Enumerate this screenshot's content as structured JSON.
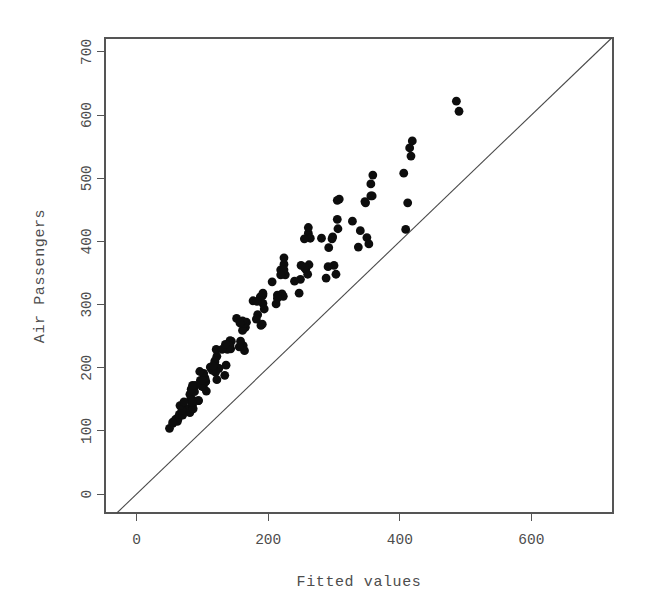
{
  "chart_data": {
    "type": "scatter",
    "title": "",
    "xlabel": "Fitted values",
    "ylabel": "Air Passengers",
    "xlim": [
      -48,
      724
    ],
    "ylim": [
      -30,
      722
    ],
    "xticks": [
      0,
      200,
      400,
      600
    ],
    "xtick_labels": [
      "0",
      "200",
      "400",
      "600"
    ],
    "yticks": [
      0,
      100,
      200,
      300,
      400,
      500,
      600,
      700
    ],
    "ytick_labels": [
      "0",
      "100",
      "200",
      "300",
      "400",
      "500",
      "600",
      "700"
    ],
    "grid": false,
    "legend": null,
    "point_color": "#0d0d0d",
    "point_radius": 4.4,
    "box": true,
    "annotations": [
      {
        "kind": "reference-line",
        "label": "identity line y = x",
        "slope": 1,
        "intercept": 0,
        "color": "#4a4a4a"
      }
    ],
    "series": [
      {
        "name": "Air Passengers vs Fitted",
        "x": [
          55,
          59,
          79,
          81,
          63,
          78,
          94,
          94,
          74,
          63,
          50,
          60,
          62,
          65,
          85,
          86,
          70,
          85,
          101,
          101,
          81,
          69,
          55,
          66,
          84,
          82,
          105,
          106,
          89,
          105,
          124,
          125,
          103,
          88,
          72,
          83,
          99,
          97,
          120,
          122,
          104,
          122,
          143,
          144,
          119,
          102,
          85,
          96,
          117,
          115,
          140,
          142,
          121,
          142,
          165,
          167,
          139,
          119,
          100,
          112,
          136,
          134,
          162,
          164,
          141,
          165,
          192,
          194,
          161,
          138,
          116,
          130,
          158,
          156,
          189,
          191,
          164,
          192,
          224,
          226,
          188,
          161,
          135,
          152,
          184,
          182,
          221,
          223,
          192,
          224,
          261,
          264,
          219,
          188,
          157,
          177,
          214,
          212,
          257,
          260,
          224,
          261,
          305,
          308,
          255,
          219,
          183,
          206,
          249,
          247,
          300,
          303,
          262,
          305,
          356,
          359,
          297,
          255,
          214,
          240,
          291,
          288,
          350,
          353,
          306,
          356,
          415,
          419,
          347,
          298,
          250,
          281,
          340,
          337,
          409,
          412,
          358,
          417,
          486,
          490,
          406,
          348,
          292,
          328
        ],
        "y": [
          112,
          118,
          132,
          129,
          121,
          135,
          148,
          148,
          136,
          119,
          104,
          118,
          115,
          126,
          141,
          135,
          125,
          149,
          170,
          170,
          158,
          133,
          114,
          140,
          145,
          150,
          178,
          163,
          172,
          178,
          199,
          199,
          184,
          162,
          146,
          166,
          171,
          180,
          193,
          181,
          183,
          218,
          230,
          242,
          209,
          191,
          172,
          194,
          196,
          196,
          236,
          235,
          229,
          243,
          264,
          272,
          237,
          211,
          180,
          201,
          204,
          188,
          235,
          227,
          234,
          264,
          302,
          293,
          259,
          229,
          203,
          229,
          242,
          233,
          267,
          269,
          270,
          315,
          364,
          347,
          312,
          274,
          237,
          278,
          284,
          277,
          317,
          313,
          318,
          374,
          413,
          405,
          355,
          306,
          271,
          306,
          315,
          301,
          356,
          348,
          355,
          422,
          465,
          467,
          404,
          347,
          305,
          336,
          340,
          318,
          362,
          348,
          363,
          435,
          491,
          505,
          404,
          359,
          310,
          337,
          360,
          342,
          406,
          396,
          420,
          472,
          548,
          559,
          463,
          407,
          362,
          405,
          417,
          391,
          419,
          461,
          472,
          535,
          622,
          606,
          508,
          461,
          390,
          432
        ]
      }
    ]
  },
  "axes": {
    "y_title": "Air Passengers",
    "x_title": "Fitted values"
  }
}
